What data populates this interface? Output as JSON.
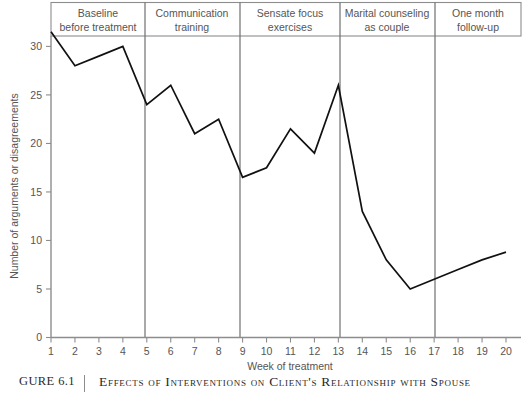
{
  "figure": {
    "number_label": "GURE 6.1",
    "caption": "Effects of Interventions on Client's Relationship with Spouse"
  },
  "chart_data": {
    "type": "line",
    "title": "",
    "xlabel": "Week of treatment",
    "ylabel": "Number of arguments or disagreements",
    "x": [
      1,
      2,
      3,
      4,
      5,
      6,
      7,
      8,
      9,
      10,
      11,
      12,
      13,
      14,
      15,
      16,
      17,
      18,
      19,
      20
    ],
    "values": [
      31.5,
      28,
      29,
      30,
      24,
      26,
      21,
      22.5,
      16.5,
      17.5,
      21.5,
      19,
      26,
      13,
      8,
      5,
      6,
      7,
      8,
      8.8
    ],
    "series": [
      {
        "name": "Arguments or disagreements",
        "values": [
          31.5,
          28,
          29,
          30,
          24,
          26,
          21,
          22.5,
          16.5,
          17.5,
          21.5,
          19,
          26,
          13,
          8,
          5,
          6,
          7,
          8,
          8.8
        ]
      }
    ],
    "xlim": [
      1,
      20
    ],
    "ylim": [
      0,
      32
    ],
    "xticks": [
      "1",
      "2",
      "3",
      "4",
      "5",
      "6",
      "7",
      "8",
      "9",
      "10",
      "11",
      "12",
      "13",
      "14",
      "15",
      "16",
      "17",
      "18",
      "19",
      "20"
    ],
    "yticks": [
      "0",
      "5",
      "10",
      "15",
      "20",
      "25",
      "30"
    ],
    "grid": false,
    "legend": "none",
    "line_color": "#111111",
    "axis_color": "#8d8d8d",
    "phases": [
      {
        "label_line1": "Baseline",
        "label_line2": "before treatment",
        "start_week": 1,
        "end_week": 5
      },
      {
        "label_line1": "Communication",
        "label_line2": "training",
        "start_week": 5,
        "end_week": 9
      },
      {
        "label_line1": "Sensate focus",
        "label_line2": "exercises",
        "start_week": 9,
        "end_week": 13
      },
      {
        "label_line1": "Marital counseling",
        "label_line2": "as couple",
        "start_week": 13,
        "end_week": 17
      },
      {
        "label_line1": "One month",
        "label_line2": "follow-up",
        "start_week": 17,
        "end_week": 20
      }
    ]
  }
}
